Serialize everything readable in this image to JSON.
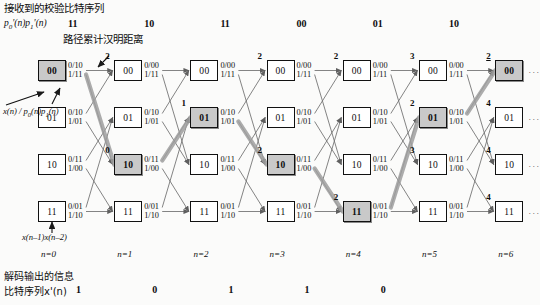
{
  "header": {
    "received_title": "接收到的校验比特序列",
    "received_symbol": "p'0(n)p'1(n)",
    "metric_caption": "路径累计汉明距离",
    "received_bits": [
      "11",
      "10",
      "11",
      "00",
      "01",
      "10"
    ]
  },
  "footer": {
    "output_title_line1": "解码输出的信息",
    "output_title_line2": "比特序列x'(n)",
    "decoded_bits": [
      "1",
      "0",
      "1",
      "1",
      "0"
    ],
    "state_def": "x(n-1)x(n-2)",
    "input_def": "x(n) / p0(n)p1(n)"
  },
  "stages": [
    {
      "label": "n=0"
    },
    {
      "label": "n=1"
    },
    {
      "label": "n=2"
    },
    {
      "label": "n=3"
    },
    {
      "label": "n=4"
    },
    {
      "label": "n=5"
    },
    {
      "label": "n=6"
    }
  ],
  "states": [
    "00",
    "01",
    "10",
    "11"
  ],
  "edge_labels": {
    "00": {
      "zero": "0/00",
      "one": "1/11"
    },
    "01": {
      "zero": "0/10",
      "one": "1/01"
    },
    "10": {
      "zero": "0/11",
      "one": "1/00"
    },
    "11": {
      "zero": "0/01",
      "one": "1/10"
    }
  },
  "first_column_edge_labels": {
    "zero": "0/10",
    "one": "1/11"
  },
  "nodes": [
    {
      "stage": 0,
      "state": "00",
      "label": "00",
      "selected": true,
      "metric": null
    },
    {
      "stage": 0,
      "state": "01",
      "label": "01",
      "selected": false,
      "metric": null
    },
    {
      "stage": 0,
      "state": "10",
      "label": "10",
      "selected": false,
      "metric": null
    },
    {
      "stage": 0,
      "state": "11",
      "label": "11",
      "selected": false,
      "metric": null
    },
    {
      "stage": 1,
      "state": "00",
      "label": "00",
      "selected": false,
      "metric": "2"
    },
    {
      "stage": 1,
      "state": "01",
      "label": "01",
      "selected": false,
      "metric": null
    },
    {
      "stage": 1,
      "state": "10",
      "label": "10",
      "selected": true,
      "metric": "0"
    },
    {
      "stage": 1,
      "state": "11",
      "label": "11",
      "selected": false,
      "metric": null
    },
    {
      "stage": 2,
      "state": "00",
      "label": "00",
      "selected": false,
      "metric": null
    },
    {
      "stage": 2,
      "state": "01",
      "label": "01",
      "selected": true,
      "metric": "1"
    },
    {
      "stage": 2,
      "state": "10",
      "label": "10",
      "selected": false,
      "metric": null
    },
    {
      "stage": 2,
      "state": "11",
      "label": "11",
      "selected": false,
      "metric": null
    },
    {
      "stage": 3,
      "state": "00",
      "label": "00",
      "selected": false,
      "metric": "2"
    },
    {
      "stage": 3,
      "state": "01",
      "label": "01",
      "selected": false,
      "metric": null
    },
    {
      "stage": 3,
      "state": "10",
      "label": "10",
      "selected": true,
      "metric": "2"
    },
    {
      "stage": 3,
      "state": "11",
      "label": "11",
      "selected": false,
      "metric": null
    },
    {
      "stage": 4,
      "state": "00",
      "label": "00",
      "selected": false,
      "metric": "2"
    },
    {
      "stage": 4,
      "state": "01",
      "label": "01",
      "selected": false,
      "metric": null
    },
    {
      "stage": 4,
      "state": "10",
      "label": "10",
      "selected": false,
      "metric": null
    },
    {
      "stage": 4,
      "state": "11",
      "label": "11",
      "selected": true,
      "metric": "2"
    },
    {
      "stage": 5,
      "state": "00",
      "label": "00",
      "selected": false,
      "metric": "3"
    },
    {
      "stage": 5,
      "state": "01",
      "label": "01",
      "selected": true,
      "metric": "2"
    },
    {
      "stage": 5,
      "state": "10",
      "label": "10",
      "selected": false,
      "metric": "3"
    },
    {
      "stage": 5,
      "state": "11",
      "label": "11",
      "selected": false,
      "metric": null
    },
    {
      "stage": 6,
      "state": "00",
      "label": "00",
      "selected": true,
      "metric": "2"
    },
    {
      "stage": 6,
      "state": "01",
      "label": "01",
      "selected": false,
      "metric": "4"
    },
    {
      "stage": 6,
      "state": "10",
      "label": "10",
      "selected": false,
      "metric": "4"
    },
    {
      "stage": 6,
      "state": "11",
      "label": "11",
      "selected": false,
      "metric": "4"
    }
  ],
  "survivor_path": [
    "00",
    "10",
    "01",
    "10",
    "11",
    "01",
    "00"
  ],
  "colors": {
    "node_fill": "#ffffff",
    "node_selected_fill": "#c9c9c9",
    "stroke": "#111111",
    "edge": "#6e6e6e",
    "survivor": "#9a9a9a",
    "background": "#fbfbfa"
  },
  "continuation_marker": "···"
}
